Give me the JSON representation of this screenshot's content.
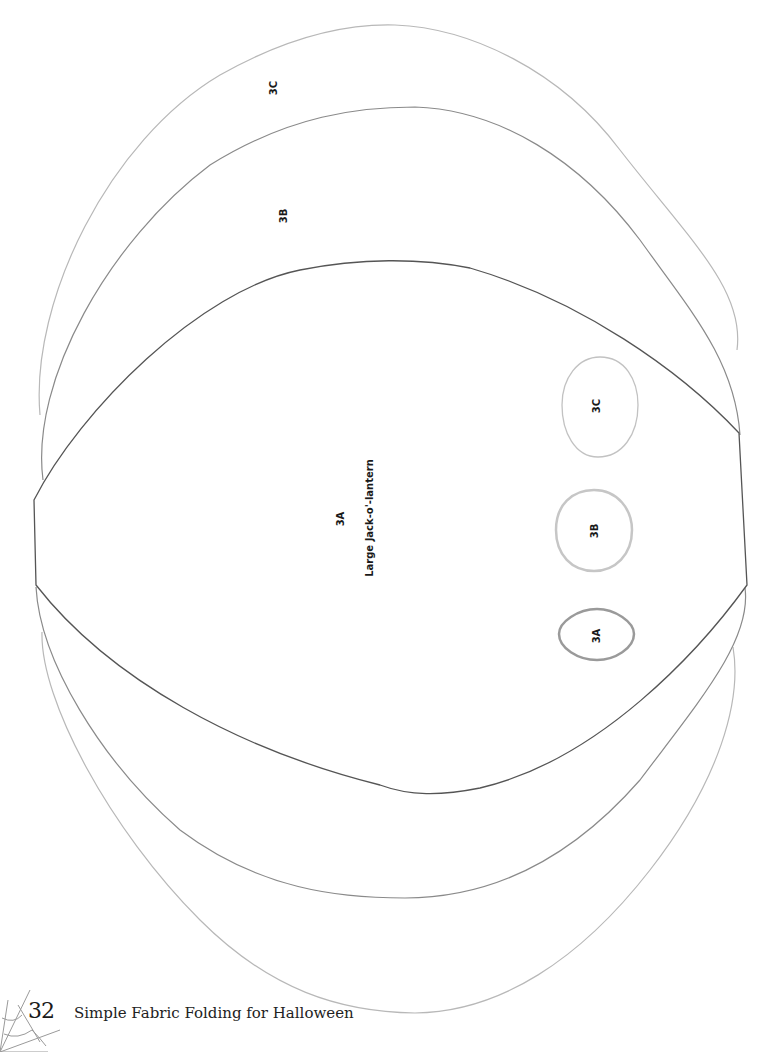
{
  "page": {
    "number": "32",
    "running_title": "Simple Fabric Folding for Halloween"
  },
  "colors": {
    "outline_3A": "#555555",
    "outline_3B": "#8a8a8a",
    "outline_3C": "#b8b8b8",
    "text": "#1a1a1a"
  },
  "pattern_pieces": {
    "large": {
      "3A": {
        "label": "3A",
        "caption": "Large Jack-o'-lantern"
      },
      "3B": {
        "label": "3B"
      },
      "3C": {
        "label": "3C"
      }
    },
    "small": {
      "3A": {
        "label": "3A"
      },
      "3B": {
        "label": "3B"
      },
      "3C": {
        "label": "3C"
      }
    }
  },
  "decoration": {
    "corner": "spider-web"
  }
}
